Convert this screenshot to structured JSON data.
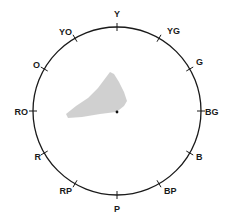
{
  "diagram": {
    "type": "hue-circle",
    "center": [
      117,
      111
    ],
    "radius": 84,
    "stroke_color": "#1a1a1a",
    "region_color": "#c8c8c8",
    "hues": [
      {
        "label": "Y",
        "angle": 0,
        "lx": 117,
        "ly": 17,
        "anchor": "middle"
      },
      {
        "label": "YG",
        "angle": 30,
        "lx": 167,
        "ly": 34,
        "anchor": "start"
      },
      {
        "label": "G",
        "angle": 60,
        "lx": 196,
        "ly": 65,
        "anchor": "start"
      },
      {
        "label": "BG",
        "angle": 90,
        "lx": 205,
        "ly": 115,
        "anchor": "start"
      },
      {
        "label": "B",
        "angle": 120,
        "lx": 196,
        "ly": 160,
        "anchor": "start"
      },
      {
        "label": "BP",
        "angle": 150,
        "lx": 164,
        "ly": 194,
        "anchor": "start"
      },
      {
        "label": "P",
        "angle": 180,
        "lx": 117,
        "ly": 212,
        "anchor": "middle"
      },
      {
        "label": "RP",
        "angle": 210,
        "lx": 72,
        "ly": 194,
        "anchor": "end"
      },
      {
        "label": "R",
        "angle": 240,
        "lx": 41,
        "ly": 160,
        "anchor": "end"
      },
      {
        "label": "RO",
        "angle": 270,
        "lx": 28,
        "ly": 115,
        "anchor": "end"
      },
      {
        "label": "O",
        "angle": 300,
        "lx": 40,
        "ly": 68,
        "anchor": "end"
      },
      {
        "label": "YO",
        "angle": 330,
        "lx": 72,
        "ly": 35,
        "anchor": "end"
      }
    ],
    "region_points": "110,72 114,74 119,82 124,92 127,101 124,106 119,110 116,112 100,114 82,117 68,118 66,114 76,106 88,98 98,88 104,80",
    "center_dot": [
      117,
      112
    ]
  }
}
